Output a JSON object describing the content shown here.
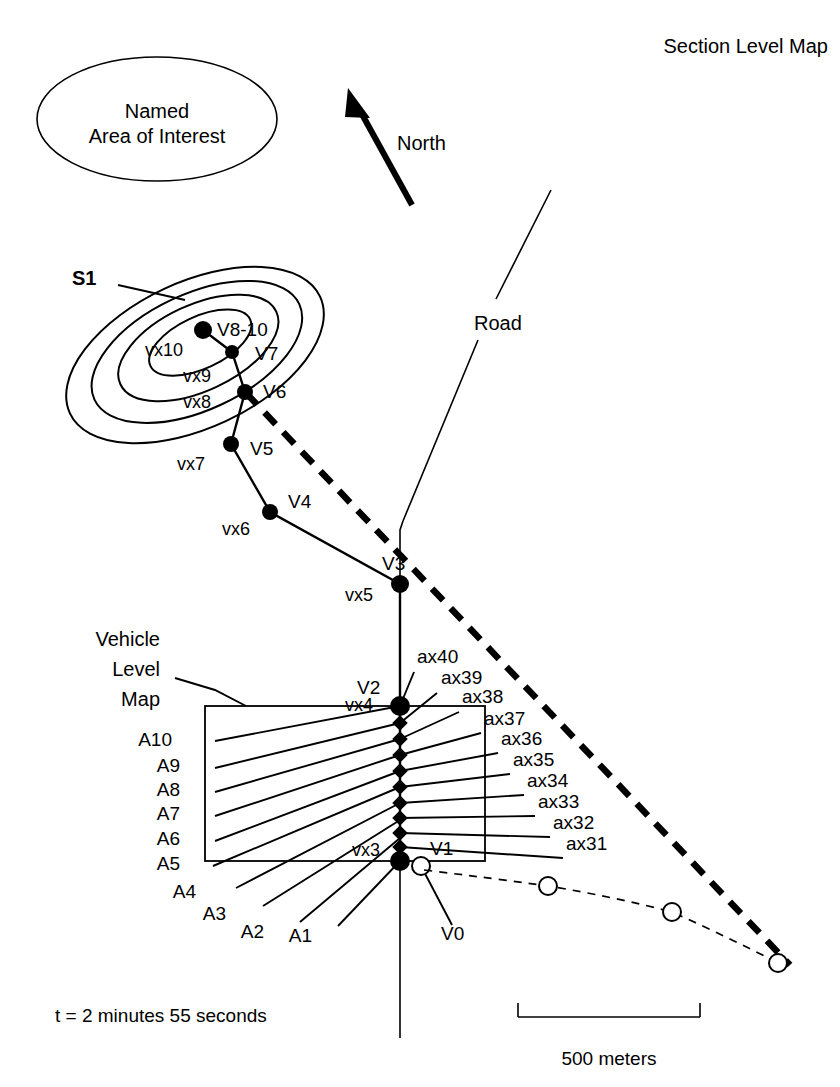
{
  "title": "Section Level Map",
  "annotations": {
    "named_area": {
      "line1": "Named",
      "line2": "Area of Interest"
    },
    "north": "North",
    "road": "Road",
    "vehicle_level_map": {
      "line1": "Vehicle",
      "line2": "Level",
      "line3": "Map"
    },
    "sector": "S1",
    "time_label": "t = 2 minutes  55 seconds",
    "scale_label": "500 meters"
  },
  "section_nodes": [
    {
      "id": "V8-10",
      "label": "V8-10",
      "vx": "vx10",
      "x": 203,
      "y": 330,
      "r": 9,
      "label_x": 217,
      "label_y": 336,
      "vx_x": 145,
      "vx_y": 356
    },
    {
      "id": "V7",
      "label": "V7",
      "vx": "vx9",
      "x": 232,
      "y": 352,
      "r": 7,
      "label_x": 255,
      "label_y": 360,
      "vx_x": 183,
      "vx_y": 382
    },
    {
      "id": "V6",
      "label": "V6",
      "vx": "vx8",
      "x": 245,
      "y": 392,
      "r": 8,
      "label_x": 263,
      "label_y": 398,
      "vx_x": 183,
      "vx_y": 408
    },
    {
      "id": "V5",
      "label": "V5",
      "vx": "vx7",
      "x": 231,
      "y": 444,
      "r": 8,
      "label_x": 250,
      "label_y": 455,
      "vx_x": 177,
      "vx_y": 470
    },
    {
      "id": "V4",
      "label": "V4",
      "vx": "vx6",
      "x": 270,
      "y": 512,
      "r": 8,
      "label_x": 288,
      "label_y": 508,
      "vx_x": 222,
      "vx_y": 535
    },
    {
      "id": "V3",
      "label": "V3",
      "vx": "vx5",
      "x": 400,
      "y": 584,
      "r": 9,
      "label_x": 382,
      "label_y": 570,
      "vx_x": 345,
      "vx_y": 601
    },
    {
      "id": "V2",
      "label": "V2",
      "vx": "vx4",
      "x": 400,
      "y": 706,
      "r": 10,
      "label_x": 357,
      "label_y": 694,
      "vx_x": 345,
      "vx_y": 711
    },
    {
      "id": "V1",
      "label": "V1",
      "vx": "vx3",
      "x": 400,
      "y": 861,
      "r": 10,
      "label_x": 430,
      "label_y": 855,
      "vx_x": 352,
      "vx_y": 856
    },
    {
      "id": "V0",
      "label": "V0",
      "vx": "",
      "x": 421,
      "y": 866,
      "r": 8,
      "label_x": 441,
      "label_y": 940,
      "vx_x": 0,
      "vx_y": 0
    }
  ],
  "vehicle_box": {
    "x": 205,
    "y": 706,
    "width": 280,
    "height": 155
  },
  "axis_labels_left": [
    {
      "label": "A10",
      "x": 172,
      "y": 746,
      "tip_x": 215,
      "tip_y": 741
    },
    {
      "label": "A9",
      "x": 180,
      "y": 772,
      "tip_x": 215,
      "tip_y": 768
    },
    {
      "label": "A8",
      "x": 180,
      "y": 796,
      "tip_x": 215,
      "tip_y": 792
    },
    {
      "label": "A7",
      "x": 180,
      "y": 820,
      "tip_x": 215,
      "tip_y": 816
    },
    {
      "label": "A6",
      "x": 180,
      "y": 845,
      "tip_x": 215,
      "tip_y": 841
    },
    {
      "label": "A5",
      "x": 180,
      "y": 870,
      "tip_x": 215,
      "tip_y": 862
    },
    {
      "label": "A4",
      "x": 196,
      "y": 898,
      "tip_x": 240,
      "tip_y": 884
    },
    {
      "label": "A3",
      "x": 226,
      "y": 920,
      "tip_x": 266,
      "tip_y": 900
    },
    {
      "label": "A2",
      "x": 264,
      "y": 938,
      "tip_x": 300,
      "tip_y": 916
    },
    {
      "label": "A1",
      "x": 312,
      "y": 942,
      "tip_x": 336,
      "tip_y": 918
    }
  ],
  "axis_labels_right": [
    {
      "label": "ax40",
      "x": 417,
      "y": 663,
      "tip_x": 410,
      "tip_y": 672
    },
    {
      "label": "ax39",
      "x": 441,
      "y": 684,
      "tip_x": 437,
      "tip_y": 693
    },
    {
      "label": "ax38",
      "x": 462,
      "y": 703,
      "tip_x": 458,
      "tip_y": 712
    },
    {
      "label": "ax37",
      "x": 484,
      "y": 725,
      "tip_x": 480,
      "tip_y": 734
    },
    {
      "label": "ax36",
      "x": 501,
      "y": 745,
      "tip_x": 497,
      "tip_y": 754
    },
    {
      "label": "ax35",
      "x": 513,
      "y": 766,
      "tip_x": 509,
      "tip_y": 775
    },
    {
      "label": "ax34",
      "x": 527,
      "y": 787,
      "tip_x": 523,
      "tip_y": 796
    },
    {
      "label": "ax33",
      "x": 538,
      "y": 808,
      "tip_x": 534,
      "tip_y": 817
    },
    {
      "label": "ax32",
      "x": 553,
      "y": 829,
      "tip_x": 549,
      "tip_y": 838
    },
    {
      "label": "ax31",
      "x": 566,
      "y": 850,
      "tip_x": 562,
      "tip_y": 859
    }
  ],
  "track_points": [
    {
      "x": 400,
      "y": 706
    },
    {
      "x": 400,
      "y": 723
    },
    {
      "x": 400,
      "y": 739
    },
    {
      "x": 400,
      "y": 755
    },
    {
      "x": 400,
      "y": 771
    },
    {
      "x": 400,
      "y": 787
    },
    {
      "x": 400,
      "y": 803
    },
    {
      "x": 400,
      "y": 818
    },
    {
      "x": 400,
      "y": 833
    },
    {
      "x": 400,
      "y": 847
    },
    {
      "x": 400,
      "y": 861
    }
  ],
  "trailing_circles": [
    {
      "x": 548,
      "y": 886
    },
    {
      "x": 672,
      "y": 912
    },
    {
      "x": 778,
      "y": 963
    }
  ],
  "scale_bar": {
    "x1": 518,
    "x2": 700,
    "y": 1017,
    "tick_height": 14
  },
  "colors": {
    "ink": "#000000",
    "background": "#ffffff"
  }
}
